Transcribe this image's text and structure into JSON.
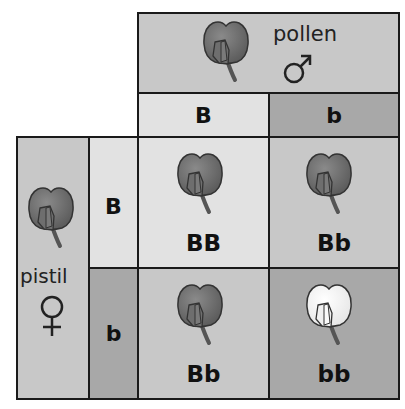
{
  "pollen": {
    "label": "pollen",
    "symbol": "male-symbol",
    "symbol_char": "♂",
    "color": "#c8c8c8"
  },
  "pistil": {
    "label": "pistil",
    "symbol": "female-symbol",
    "symbol_char": "♀",
    "color": "#c8c8c8"
  },
  "pollen_alleles": [
    {
      "label": "B",
      "color": "#e2e2e2"
    },
    {
      "label": "b",
      "color": "#a8a8a8"
    }
  ],
  "pistil_alleles": [
    {
      "label": "B",
      "color": "#e2e2e2"
    },
    {
      "label": "b",
      "color": "#a8a8a8"
    }
  ],
  "offspring": [
    {
      "genotype": "BB",
      "flower": "purple",
      "color": "#e2e2e2"
    },
    {
      "genotype": "Bb",
      "flower": "purple",
      "color": "#c8c8c8"
    },
    {
      "genotype": "Bb",
      "flower": "purple",
      "color": "#c8c8c8"
    },
    {
      "genotype": "bb",
      "flower": "white",
      "color": "#a8a8a8"
    }
  ],
  "colors": {
    "flower_dark": "#6e6e6e",
    "flower_white": "#f2f2f2",
    "border": "#1a1a1a"
  }
}
